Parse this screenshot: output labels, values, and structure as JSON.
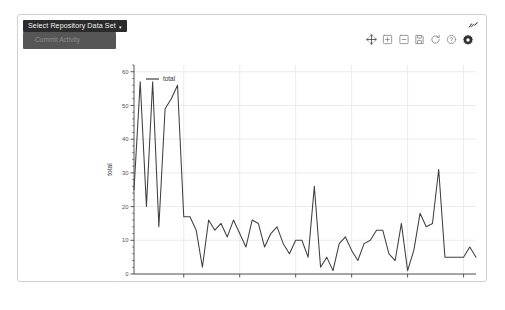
{
  "dropdown": {
    "button_label": "Select Repository Data Set",
    "caret": "▾",
    "items": [
      {
        "label": "Commit Activity"
      }
    ]
  },
  "corner": {
    "icon_name": "expand-edit-icon"
  },
  "modebar": {
    "buttons": [
      {
        "name": "pan-icon",
        "title": "Pan"
      },
      {
        "name": "zoom-in-box-icon",
        "title": "Zoom in"
      },
      {
        "name": "zoom-out-box-icon",
        "title": "Zoom out"
      },
      {
        "name": "save-camera-icon",
        "title": "Download plot"
      },
      {
        "name": "autoscale-icon",
        "title": "Autoscale"
      },
      {
        "name": "help-icon",
        "title": "Help"
      },
      {
        "name": "settings-gear-icon",
        "title": "Settings"
      }
    ]
  },
  "colors": {
    "line": "#3f3f3f",
    "grid": "#e6e6e6",
    "axis": "#444444",
    "card_border": "#cfcfcf",
    "dropdown_bg": "#2b2b2b",
    "menu_bg": "#565656"
  },
  "caption": {
    "text": ""
  },
  "chart_data": {
    "type": "line",
    "title": "",
    "xlabel": "week",
    "ylabel": "total",
    "grid": true,
    "legend_position": "top-left",
    "ylim": [
      0,
      62
    ],
    "yticks": [
      0,
      10,
      20,
      30,
      40,
      50,
      60
    ],
    "xticks": [
      "Mar17",
      "May17",
      "Jul17",
      "Sep17",
      "Nov17",
      "Jan18"
    ],
    "xtick_index": [
      8,
      17,
      26,
      35,
      44,
      53
    ],
    "series": [
      {
        "name": "total",
        "values": [
          25,
          57,
          20,
          57,
          14,
          49,
          52,
          56,
          17,
          17,
          13,
          2,
          16,
          13,
          15,
          11,
          16,
          12,
          8,
          16,
          15,
          8,
          12,
          14,
          9,
          6,
          10,
          10,
          5,
          26,
          2,
          5,
          1,
          9,
          11,
          7,
          4,
          9,
          10,
          13,
          13,
          6,
          4,
          15,
          1,
          7,
          18,
          14,
          15,
          31,
          5,
          5,
          5,
          5,
          8,
          5
        ]
      }
    ]
  }
}
